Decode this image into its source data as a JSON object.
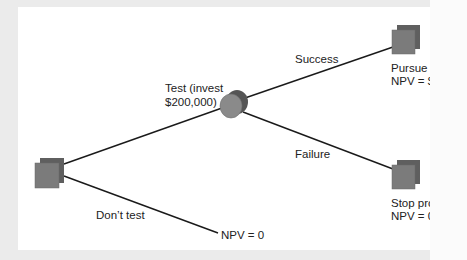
{
  "diagram": {
    "type": "decision-tree",
    "colors": {
      "background": "#ebebeb",
      "panel": "#ffffff",
      "line": "#1a1a1a",
      "node_square_back": "#5f5f5f",
      "node_square_front": "#7b7b7b",
      "node_circle_back": "#555555",
      "node_circle_front": "#8a8a8a",
      "text": "#222222"
    },
    "nodes": [
      {
        "id": "root",
        "kind": "decision",
        "shape": "square"
      },
      {
        "id": "test",
        "kind": "chance",
        "shape": "circle"
      },
      {
        "id": "pursue",
        "kind": "decision",
        "shape": "square"
      },
      {
        "id": "stop",
        "kind": "decision",
        "shape": "square"
      },
      {
        "id": "no-test-end",
        "kind": "terminal"
      }
    ],
    "edges": [
      {
        "from": "root",
        "to": "test",
        "label": "Test (invest $200,000)"
      },
      {
        "from": "root",
        "to": "no-test-end",
        "label": "Don't test"
      },
      {
        "from": "test",
        "to": "pursue",
        "label": "Success"
      },
      {
        "from": "test",
        "to": "stop",
        "label": "Failure"
      }
    ]
  },
  "labels": {
    "test_line1": "Test (invest",
    "test_line2": "$200,000)",
    "success": "Success",
    "failure": "Failure",
    "dont_test": "Don’t test",
    "no_test_npv": "NPV = 0",
    "pursue_line1": "Pursue pr",
    "pursue_line2": "NPV = $:",
    "stop_line1": "Stop proj",
    "stop_line2": "NPV = 0"
  }
}
